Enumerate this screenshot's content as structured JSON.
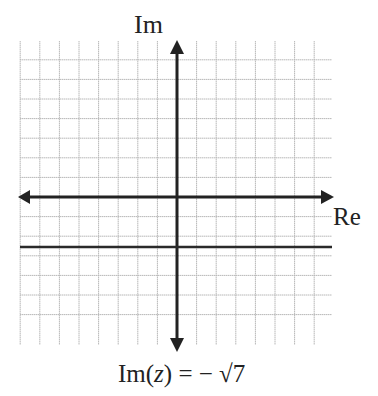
{
  "axes": {
    "imaginary_label": "Im",
    "real_label": "Re"
  },
  "grid": {
    "x_min": -8,
    "x_max": 8,
    "y_min": -8,
    "y_max": 7,
    "spacing_px": 19.6
  },
  "line": {
    "equation_prefix": "Im(",
    "equation_var": "z",
    "equation_suffix": ") = − √7",
    "y_value": -2.6458
  },
  "colors": {
    "grid": "#b5b5b5",
    "axis": "#222222",
    "line": "#2a2a2a"
  }
}
